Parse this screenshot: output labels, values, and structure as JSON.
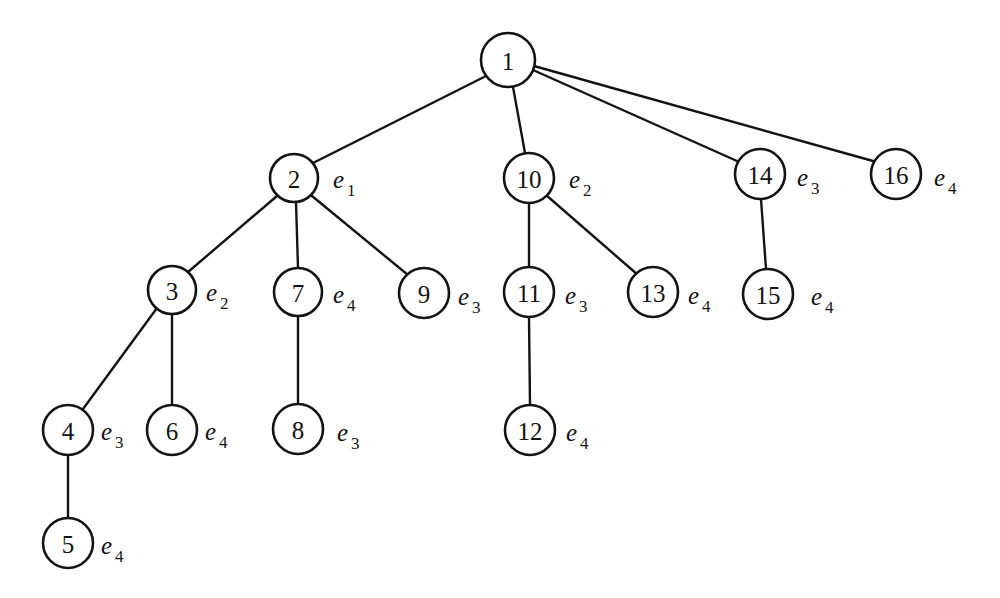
{
  "diagram": {
    "background_color": "#ffffff",
    "stroke_color": "#131313",
    "node_fill": "#ffffff",
    "nodes": [
      {
        "id": "1",
        "label": "1",
        "cx": 508,
        "cy": 60,
        "r": 27
      },
      {
        "id": "2",
        "label": "2",
        "cx": 294,
        "cy": 178,
        "r": 24
      },
      {
        "id": "10",
        "label": "10",
        "cx": 529,
        "cy": 178,
        "r": 25
      },
      {
        "id": "14",
        "label": "14",
        "cx": 760,
        "cy": 174,
        "r": 25
      },
      {
        "id": "16",
        "label": "16",
        "cx": 896,
        "cy": 174,
        "r": 25
      },
      {
        "id": "3",
        "label": "3",
        "cx": 172,
        "cy": 290,
        "r": 24
      },
      {
        "id": "7",
        "label": "7",
        "cx": 298,
        "cy": 292,
        "r": 24
      },
      {
        "id": "9",
        "label": "9",
        "cx": 424,
        "cy": 293,
        "r": 25
      },
      {
        "id": "11",
        "label": "11",
        "cx": 529,
        "cy": 292,
        "r": 25
      },
      {
        "id": "13",
        "label": "13",
        "cx": 653,
        "cy": 292,
        "r": 25
      },
      {
        "id": "15",
        "label": "15",
        "cx": 768,
        "cy": 294,
        "r": 25
      },
      {
        "id": "4",
        "label": "4",
        "cx": 68,
        "cy": 430,
        "r": 25
      },
      {
        "id": "6",
        "label": "6",
        "cx": 172,
        "cy": 430,
        "r": 25
      },
      {
        "id": "8",
        "label": "8",
        "cx": 298,
        "cy": 429,
        "r": 25
      },
      {
        "id": "12",
        "label": "12",
        "cx": 530,
        "cy": 430,
        "r": 25
      },
      {
        "id": "5",
        "label": "5",
        "cx": 68,
        "cy": 543,
        "r": 25
      }
    ],
    "edges": [
      {
        "from": "1",
        "to": "2",
        "x1": 486,
        "y1": 76,
        "x2": 313,
        "y2": 163
      },
      {
        "from": "1",
        "to": "10",
        "x1": 513,
        "y1": 87,
        "x2": 525,
        "y2": 153
      },
      {
        "from": "1",
        "to": "14",
        "x1": 533,
        "y1": 70,
        "x2": 737,
        "y2": 161
      },
      {
        "from": "1",
        "to": "16",
        "x1": 534,
        "y1": 66,
        "x2": 873,
        "y2": 161
      },
      {
        "from": "2",
        "to": "3",
        "x1": 277,
        "y1": 196,
        "x2": 188,
        "y2": 272
      },
      {
        "from": "2",
        "to": "7",
        "x1": 296,
        "y1": 202,
        "x2": 298,
        "y2": 268
      },
      {
        "from": "2",
        "to": "9",
        "x1": 312,
        "y1": 196,
        "x2": 408,
        "y2": 275
      },
      {
        "from": "3",
        "to": "4",
        "x1": 157,
        "y1": 308,
        "x2": 83,
        "y2": 409
      },
      {
        "from": "3",
        "to": "6",
        "x1": 172,
        "y1": 314,
        "x2": 172,
        "y2": 405
      },
      {
        "from": "4",
        "to": "5",
        "x1": 68,
        "y1": 455,
        "x2": 68,
        "y2": 518
      },
      {
        "from": "7",
        "to": "8",
        "x1": 298,
        "y1": 316,
        "x2": 298,
        "y2": 404
      },
      {
        "from": "10",
        "to": "11",
        "x1": 529,
        "y1": 203,
        "x2": 529,
        "y2": 267
      },
      {
        "from": "10",
        "to": "13",
        "x1": 546,
        "y1": 195,
        "x2": 638,
        "y2": 275
      },
      {
        "from": "11",
        "to": "12",
        "x1": 529,
        "y1": 317,
        "x2": 530,
        "y2": 405
      },
      {
        "from": "14",
        "to": "15",
        "x1": 761,
        "y1": 199,
        "x2": 766,
        "y2": 269
      }
    ],
    "edge_tags": [
      {
        "node": "2",
        "base": "e",
        "sub": "1",
        "x": 333,
        "y": 179
      },
      {
        "node": "10",
        "base": "e",
        "sub": "2",
        "x": 569,
        "y": 179
      },
      {
        "node": "14",
        "base": "e",
        "sub": "3",
        "x": 797,
        "y": 177
      },
      {
        "node": "16",
        "base": "e",
        "sub": "4",
        "x": 934,
        "y": 177
      },
      {
        "node": "3",
        "base": "e",
        "sub": "2",
        "x": 206,
        "y": 292
      },
      {
        "node": "7",
        "base": "e",
        "sub": "4",
        "x": 333,
        "y": 294
      },
      {
        "node": "9",
        "base": "e",
        "sub": "3",
        "x": 458,
        "y": 296
      },
      {
        "node": "11",
        "base": "e",
        "sub": "3",
        "x": 565,
        "y": 295
      },
      {
        "node": "13",
        "base": "e",
        "sub": "4",
        "x": 688,
        "y": 295
      },
      {
        "node": "15",
        "base": "e",
        "sub": "4",
        "x": 811,
        "y": 296
      },
      {
        "node": "4",
        "base": "e",
        "sub": "3",
        "x": 101,
        "y": 431
      },
      {
        "node": "6",
        "base": "e",
        "sub": "4",
        "x": 205,
        "y": 431
      },
      {
        "node": "8",
        "base": "e",
        "sub": "3",
        "x": 337,
        "y": 432
      },
      {
        "node": "12",
        "base": "e",
        "sub": "4",
        "x": 566,
        "y": 432
      },
      {
        "node": "5",
        "base": "e",
        "sub": "4",
        "x": 101,
        "y": 545
      }
    ]
  }
}
